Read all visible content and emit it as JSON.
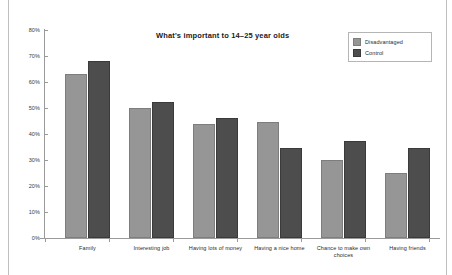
{
  "chart_data": {
    "type": "bar",
    "title": "What's important to 14–25 year olds",
    "xlabel": "",
    "ylabel": "",
    "ylim": [
      0,
      80
    ],
    "ytick_labels": [
      "0%",
      "10%",
      "20%",
      "30%",
      "40%",
      "50%",
      "60%",
      "70%",
      "80%"
    ],
    "ytick_values": [
      0,
      10,
      20,
      30,
      40,
      50,
      60,
      70,
      80
    ],
    "grid": false,
    "legend_position": "top-right",
    "categories": [
      "Family",
      "Interesting job",
      "Having lots of money",
      "Having a nice home",
      "Chance to make own choices",
      "Having friends"
    ],
    "series": [
      {
        "name": "Disadvantaged",
        "color": "#969696",
        "values": [
          63,
          50,
          44,
          44.5,
          30,
          25
        ]
      },
      {
        "name": "Control",
        "color": "#4d4d4d",
        "values": [
          68,
          52.5,
          46,
          34.5,
          37.5,
          34.5
        ]
      }
    ]
  }
}
